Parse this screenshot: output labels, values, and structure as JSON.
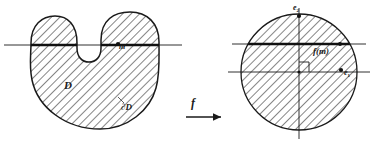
{
  "figure": {
    "type": "math-diagram",
    "background_color": "#ffffff",
    "ink_color": "#1a1a1a",
    "hatch_color": "#333333"
  },
  "labels": {
    "domain": "D",
    "boundary": "∂D",
    "point_m": "m",
    "map": "f",
    "axis_e2": "e",
    "axis_e2_sub": "2",
    "axis_e1": "e",
    "axis_e1_sub": "1",
    "image_point": "f(m)"
  },
  "left_panel": {
    "name": "source-domain",
    "shape": "kidney",
    "hatched": true,
    "secant_line": "horizontal chord line through upper lobes",
    "marked_point": "m"
  },
  "right_panel": {
    "name": "target-disc",
    "shape": "circle",
    "hatched": true,
    "axes": [
      "e1",
      "e2"
    ],
    "right_angle_marker": true,
    "secant_line": "horizontal chord line above center",
    "marked_points": [
      "e2",
      "e1",
      "f(m)"
    ]
  },
  "arrow": {
    "name": "map-arrow",
    "label": "f",
    "direction": "left-to-right"
  }
}
